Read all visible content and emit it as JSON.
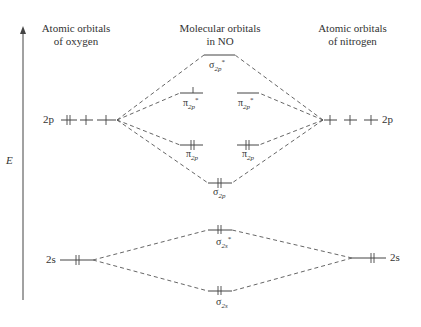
{
  "headers": {
    "left": [
      "Atomic orbitals",
      "of oxygen"
    ],
    "center": [
      "Molecular orbitals",
      "in NO"
    ],
    "right": [
      "Atomic orbitals",
      "of nitrogen"
    ]
  },
  "axis": {
    "label": "E",
    "direction": "up"
  },
  "atomic_orbitals": {
    "oxygen": {
      "2p": {
        "label": "2p",
        "occupancy": [
          "up-down",
          "up",
          "up"
        ]
      },
      "2s": {
        "label": "2s",
        "occupancy": [
          "up-down"
        ]
      }
    },
    "nitrogen": {
      "2p": {
        "label": "2p",
        "occupancy": [
          "up",
          "up",
          "up"
        ]
      },
      "2s": {
        "label": "2s",
        "occupancy": [
          "up-down"
        ]
      }
    }
  },
  "molecular_orbitals": [
    {
      "id": "sigma2p_star",
      "symbol": "σ",
      "sub": "2p",
      "sup": "*",
      "electrons": 0
    },
    {
      "id": "pi2p_star_a",
      "symbol": "π",
      "sub": "2p",
      "sup": "*",
      "electrons": 1
    },
    {
      "id": "pi2p_star_b",
      "symbol": "π",
      "sub": "2p",
      "sup": "*",
      "electrons": 0
    },
    {
      "id": "pi2p_a",
      "symbol": "π",
      "sub": "2p",
      "sup": "",
      "electrons": 2
    },
    {
      "id": "pi2p_b",
      "symbol": "π",
      "sub": "2p",
      "sup": "",
      "electrons": 2
    },
    {
      "id": "sigma2p",
      "symbol": "σ",
      "sub": "2p",
      "sup": "",
      "electrons": 2
    },
    {
      "id": "sigma2s_star",
      "symbol": "σ",
      "sub": "2s",
      "sup": "*",
      "electrons": 2
    },
    {
      "id": "sigma2s",
      "symbol": "σ",
      "sub": "2s",
      "sup": "",
      "electrons": 2
    }
  ],
  "colors": {
    "line": "#444444",
    "text": "#333333",
    "background": "#ffffff"
  }
}
